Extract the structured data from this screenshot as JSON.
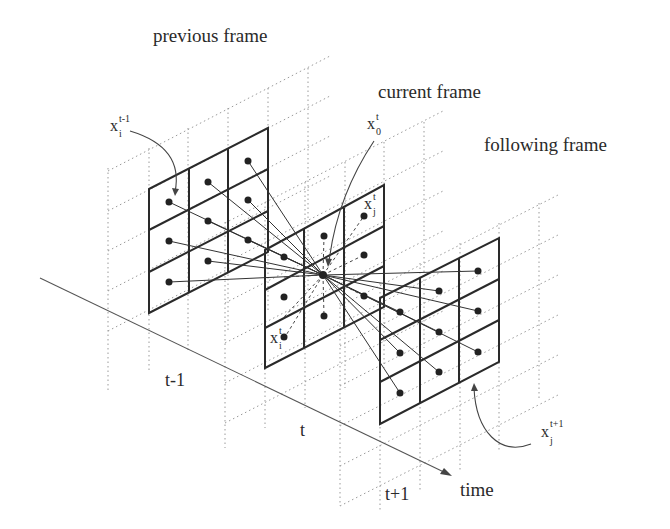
{
  "labels": {
    "previous_frame": "previous frame",
    "current_frame": "current frame",
    "following_frame": "following frame",
    "time_axis": "time",
    "tick_t_minus_1": "t-1",
    "tick_t": "t",
    "tick_t_plus_1": "t+1"
  },
  "variables": {
    "x_prev": {
      "base": "x",
      "sub": "i",
      "sup": "t-1"
    },
    "x_center": {
      "base": "x",
      "sub": "0",
      "sup": "t"
    },
    "x_cur_j": {
      "base": "x",
      "sub": "j",
      "sup": "t"
    },
    "x_cur_i": {
      "base": "x",
      "sub": "i",
      "sup": "t"
    },
    "x_next": {
      "base": "x",
      "sub": "j",
      "sup": "t+1"
    }
  },
  "frames": [
    {
      "name": "previous frame",
      "time": "t-1",
      "rows": 3,
      "cols": 3
    },
    {
      "name": "current frame",
      "time": "t",
      "rows": 3,
      "cols": 3
    },
    {
      "name": "following frame",
      "time": "t+1",
      "rows": 3,
      "cols": 3
    }
  ],
  "colors": {
    "ink": "#2a2a2a",
    "grid_dotted": "#9a9a9a",
    "background": "#ffffff"
  }
}
